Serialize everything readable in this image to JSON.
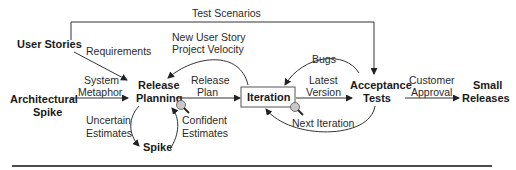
{
  "diagram": {
    "nodes": {
      "user_stories": "User Stories",
      "architectural_spike_1": "Architectural",
      "architectural_spike_2": "Spike",
      "release_planning_1": "Release",
      "release_planning_2": "Planning",
      "spike": "Spike",
      "iteration": "Iteration",
      "acceptance_tests_1": "Acceptance",
      "acceptance_tests_2": "Tests",
      "small_releases_1": "Small",
      "small_releases_2": "Releases"
    },
    "edges": {
      "test_scenarios": "Test Scenarios",
      "requirements": "Requirements",
      "system_metaphor_1": "System",
      "system_metaphor_2": "Metaphor",
      "new_user_story_1": "New User Story",
      "new_user_story_2": "Project Velocity",
      "release_plan_1": "Release",
      "release_plan_2": "Plan",
      "uncertain_estimates_1": "Uncertain",
      "uncertain_estimates_2": "Estimates",
      "confident_estimates_1": "Confident",
      "confident_estimates_2": "Estimates",
      "bugs": "Bugs",
      "latest_version_1": "Latest",
      "latest_version_2": "Version",
      "next_iteration": "Next Iteration",
      "customer_approval_1": "Customer",
      "customer_approval_2": "Approval"
    },
    "icons": [
      "magnifier-icon",
      "magnifier-icon"
    ],
    "colors": {
      "line": "#333333",
      "text": "#1a1a1a",
      "magnifier_fill": "#c8c8c8"
    }
  }
}
